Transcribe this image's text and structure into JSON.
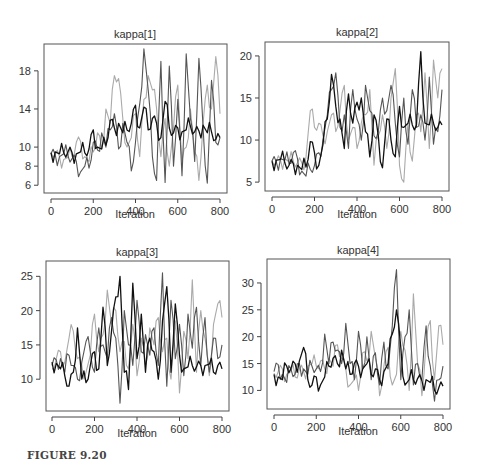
{
  "figure_label": "FIGURE 9.20",
  "chain_colors": [
    "#111111",
    "#555555",
    "#aaaaaa"
  ],
  "chart_data": [
    {
      "type": "line",
      "title": "kappa[1]",
      "xlabel": "Iteration",
      "ylabel": "",
      "xlim": [
        0,
        800
      ],
      "ylim": [
        5.5,
        20.5
      ],
      "xticks": [
        0,
        200,
        400,
        600,
        800
      ],
      "yticks": [
        6,
        8,
        10,
        14,
        18
      ],
      "grid": false,
      "legend": "none",
      "x": [
        0,
        20,
        40,
        60,
        80,
        100,
        120,
        140,
        160,
        180,
        200,
        220,
        240,
        260,
        280,
        300,
        320,
        340,
        360,
        380,
        400,
        420,
        440,
        460,
        480,
        500,
        520,
        540,
        560,
        580,
        600,
        620,
        640,
        660,
        680,
        700,
        720,
        740,
        760,
        780,
        800
      ],
      "series": [
        {
          "name": "chain 1",
          "values": [
            9.4,
            9.5,
            9.3,
            9.4,
            9.5,
            9.4,
            9.3,
            9.5,
            9.4,
            9.8,
            11.8,
            10.0,
            9.8,
            10.2,
            12.8,
            12.0,
            12.5,
            11.5,
            11.8,
            12.5,
            14.4,
            12.0,
            14.2,
            11.8,
            13.0,
            12.5,
            11.0,
            14.8,
            12.0,
            11.5,
            12.0,
            11.6,
            11.8,
            12.2,
            11.6,
            11.7,
            12.3,
            11.5,
            11.6,
            10.8,
            11.0
          ]
        },
        {
          "name": "chain 2",
          "values": [
            9.3,
            9.2,
            9.0,
            9.3,
            9.1,
            8.8,
            8.5,
            7.4,
            8.0,
            7.8,
            10.5,
            9.7,
            11.5,
            10.0,
            11.8,
            13.5,
            9.8,
            12.5,
            10.5,
            7.5,
            10.5,
            14.5,
            20.3,
            16.0,
            9.0,
            6.5,
            19.0,
            6.3,
            18.5,
            8.0,
            15.0,
            7.0,
            19.8,
            13.0,
            8.5,
            19.3,
            12.0,
            6.2,
            17.0,
            10.5,
            11.0
          ]
        },
        {
          "name": "chain 3",
          "values": [
            9.5,
            9.3,
            9.0,
            8.7,
            8.9,
            9.0,
            10.5,
            10.6,
            9.0,
            8.5,
            9.5,
            11.5,
            9.8,
            14.0,
            12.5,
            17.5,
            17.2,
            13.0,
            10.0,
            11.0,
            13.5,
            9.0,
            15.0,
            17.5,
            16.0,
            14.0,
            9.0,
            13.0,
            8.0,
            12.0,
            16.5,
            8.5,
            10.0,
            14.0,
            9.5,
            6.5,
            12.5,
            16.5,
            14.0,
            19.5,
            13.5
          ]
        }
      ]
    },
    {
      "type": "line",
      "title": "kappa[2]",
      "xlabel": "Iteration",
      "ylabel": "",
      "xlim": [
        0,
        800
      ],
      "ylim": [
        4.3,
        21.3
      ],
      "xticks": [
        0,
        200,
        400,
        600,
        800
      ],
      "yticks": [
        5,
        10,
        15,
        20
      ],
      "grid": false,
      "legend": "none",
      "x": [
        0,
        20,
        40,
        60,
        80,
        100,
        120,
        140,
        160,
        180,
        200,
        220,
        240,
        260,
        280,
        300,
        320,
        340,
        360,
        380,
        400,
        420,
        440,
        460,
        480,
        500,
        520,
        540,
        560,
        580,
        600,
        620,
        640,
        660,
        680,
        700,
        720,
        740,
        760,
        780,
        800
      ],
      "series": [
        {
          "name": "chain 1",
          "values": [
            7.5,
            7.6,
            7.7,
            7.3,
            7.0,
            7.2,
            7.0,
            6.5,
            6.8,
            9.8,
            8.5,
            7.0,
            9.5,
            12.5,
            17.8,
            14.0,
            12.5,
            9.0,
            15.5,
            12.0,
            14.5,
            15.0,
            11.0,
            8.0,
            13.0,
            10.5,
            6.7,
            12.5,
            10.0,
            8.0,
            14.0,
            11.5,
            12.0,
            11.8,
            11.8,
            20.5,
            12.0,
            11.8,
            12.0,
            11.5,
            11.8
          ]
        },
        {
          "name": "chain 2",
          "values": [
            7.5,
            7.4,
            7.8,
            7.6,
            7.2,
            8.5,
            7.8,
            6.3,
            5.7,
            6.5,
            7.0,
            8.5,
            10.0,
            13.0,
            16.0,
            18.0,
            11.5,
            13.0,
            9.0,
            16.0,
            12.5,
            10.0,
            16.5,
            13.5,
            10.5,
            11.0,
            15.0,
            13.5,
            16.5,
            12.0,
            8.0,
            15.0,
            9.5,
            16.0,
            11.5,
            13.0,
            10.0,
            17.5,
            9.5,
            11.0,
            16.0
          ]
        },
        {
          "name": "chain 3",
          "values": [
            7.6,
            7.5,
            7.6,
            7.8,
            7.4,
            7.5,
            7.3,
            7.3,
            8.0,
            13.5,
            11.5,
            12.0,
            10.5,
            11.0,
            13.0,
            11.0,
            13.5,
            16.5,
            10.0,
            11.5,
            9.0,
            12.0,
            13.0,
            16.0,
            7.0,
            10.5,
            13.0,
            9.0,
            15.0,
            18.5,
            7.0,
            5.0,
            12.0,
            7.5,
            13.0,
            11.0,
            18.0,
            9.0,
            19.5,
            15.0,
            18.5
          ]
        }
      ]
    },
    {
      "type": "line",
      "title": "kappa[3]",
      "xlabel": "Iteration",
      "ylabel": "",
      "xlim": [
        0,
        800
      ],
      "ylim": [
        5.8,
        26.8
      ],
      "xticks": [
        0,
        200,
        400,
        600,
        800
      ],
      "yticks": [
        10,
        15,
        20,
        25
      ],
      "grid": false,
      "legend": "none",
      "x": [
        0,
        20,
        40,
        60,
        80,
        100,
        120,
        140,
        160,
        180,
        200,
        220,
        240,
        260,
        280,
        300,
        320,
        340,
        360,
        380,
        400,
        420,
        440,
        460,
        480,
        500,
        520,
        540,
        560,
        580,
        600,
        620,
        640,
        660,
        680,
        700,
        720,
        740,
        760,
        780,
        800
      ],
      "series": [
        {
          "name": "chain 1",
          "values": [
            12.5,
            12.3,
            11.5,
            10.5,
            9.0,
            11.0,
            17.5,
            10.0,
            9.5,
            12.0,
            14.0,
            11.5,
            20.5,
            12.0,
            17.0,
            22.0,
            25.0,
            11.0,
            8.5,
            24.0,
            13.0,
            19.5,
            11.0,
            16.0,
            14.0,
            10.0,
            18.5,
            23.5,
            11.0,
            21.0,
            13.5,
            11.5,
            11.8,
            12.0,
            11.8,
            12.0,
            12.0,
            12.2,
            11.0,
            12.0,
            11.5
          ]
        },
        {
          "name": "chain 2",
          "values": [
            12.0,
            12.8,
            13.0,
            11.0,
            13.5,
            12.0,
            10.0,
            12.5,
            15.5,
            14.0,
            11.0,
            17.5,
            15.0,
            13.0,
            19.0,
            16.0,
            6.5,
            20.0,
            15.0,
            12.0,
            21.5,
            14.0,
            16.5,
            13.5,
            17.5,
            12.0,
            25.5,
            9.0,
            21.5,
            13.0,
            18.0,
            10.5,
            19.5,
            14.5,
            20.5,
            12.0,
            19.0,
            11.0,
            16.0,
            13.0,
            15.0
          ]
        },
        {
          "name": "chain 3",
          "values": [
            11.5,
            13.0,
            14.0,
            12.5,
            16.0,
            17.0,
            13.0,
            12.0,
            11.0,
            13.5,
            19.5,
            14.0,
            16.5,
            23.0,
            18.0,
            20.0,
            14.0,
            15.5,
            11.5,
            18.0,
            10.5,
            16.0,
            12.0,
            17.5,
            15.0,
            19.0,
            14.0,
            16.0,
            10.0,
            18.5,
            8.0,
            17.0,
            13.0,
            24.5,
            11.0,
            20.0,
            16.0,
            10.5,
            18.0,
            21.0,
            19.0
          ]
        }
      ]
    },
    {
      "type": "line",
      "title": "kappa[4]",
      "xlabel": "Iteration",
      "ylabel": "",
      "xlim": [
        0,
        800
      ],
      "ylim": [
        7.1,
        33.9
      ],
      "xticks": [
        0,
        200,
        400,
        600,
        800
      ],
      "yticks": [
        10,
        15,
        20,
        25,
        30
      ],
      "grid": false,
      "legend": "none",
      "x": [
        0,
        20,
        40,
        60,
        80,
        100,
        120,
        140,
        160,
        180,
        200,
        220,
        240,
        260,
        280,
        300,
        320,
        340,
        360,
        380,
        400,
        420,
        440,
        460,
        480,
        500,
        520,
        540,
        560,
        580,
        600,
        620,
        640,
        660,
        680,
        700,
        720,
        740,
        760,
        780,
        800
      ],
      "series": [
        {
          "name": "chain 1",
          "values": [
            13.0,
            12.5,
            12.0,
            14.5,
            14.0,
            15.0,
            15.5,
            18.0,
            12.0,
            11.0,
            12.5,
            11.0,
            12.5,
            14.5,
            16.0,
            15.0,
            17.5,
            14.0,
            13.0,
            15.0,
            14.5,
            14.0,
            15.0,
            13.0,
            14.0,
            12.0,
            13.5,
            15.0,
            20.5,
            25.0,
            18.0,
            11.0,
            12.0,
            12.0,
            12.2,
            11.8,
            12.0,
            11.5,
            10.0,
            10.5,
            10.8
          ]
        },
        {
          "name": "chain 2",
          "values": [
            13.5,
            14.8,
            13.0,
            11.5,
            14.0,
            13.0,
            15.0,
            14.0,
            13.0,
            14.5,
            14.0,
            13.5,
            20.5,
            15.0,
            19.0,
            17.5,
            15.0,
            22.5,
            15.0,
            12.0,
            21.0,
            14.0,
            20.0,
            12.0,
            17.0,
            11.0,
            19.0,
            14.0,
            22.0,
            32.5,
            12.0,
            20.0,
            25.0,
            11.0,
            15.0,
            12.0,
            22.0,
            14.5,
            8.0,
            12.0,
            14.5
          ]
        },
        {
          "name": "chain 3",
          "values": [
            13.2,
            13.5,
            14.0,
            13.0,
            13.5,
            12.5,
            14.0,
            13.5,
            14.5,
            15.0,
            14.5,
            15.5,
            14.0,
            16.0,
            14.5,
            18.5,
            16.0,
            14.0,
            11.0,
            12.0,
            10.0,
            17.0,
            15.5,
            21.0,
            16.0,
            9.0,
            14.5,
            18.0,
            11.0,
            13.0,
            21.0,
            17.5,
            10.0,
            28.0,
            15.0,
            9.0,
            19.0,
            23.0,
            12.0,
            22.0,
            18.5
          ]
        }
      ]
    }
  ]
}
